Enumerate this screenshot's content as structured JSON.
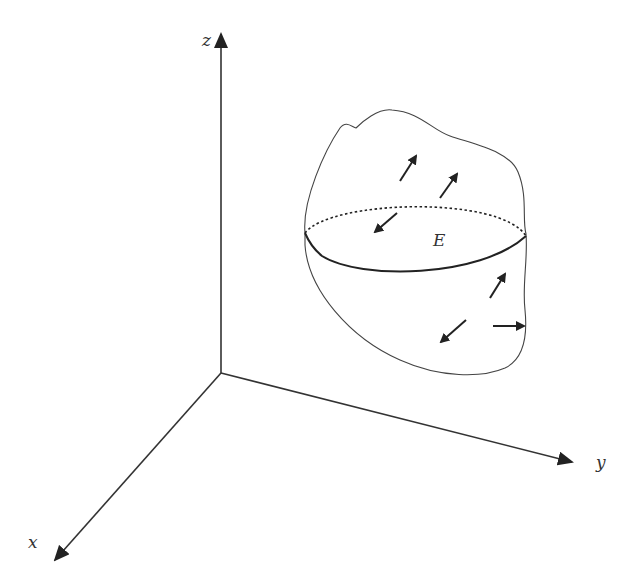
{
  "figure": {
    "type": "3d-coordinate-diagram",
    "axes": {
      "x_label": "x",
      "y_label": "y",
      "z_label": "z"
    },
    "region_label": "E",
    "arrows_count": 7,
    "colors": {
      "stroke": "#222222",
      "background": "#ffffff"
    }
  }
}
